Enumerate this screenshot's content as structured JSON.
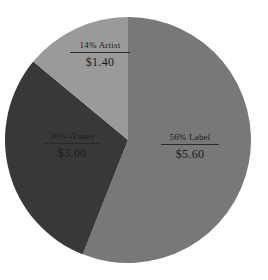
{
  "chart_data": {
    "type": "pie",
    "title": "",
    "subtitle": "",
    "xlabel": "",
    "ylabel": "",
    "legend": "none",
    "grid": false,
    "total_value": "$10.00",
    "start_angle_deg": 0,
    "direction": "clockwise",
    "categories": [
      "Label",
      "iTunes",
      "Artist"
    ],
    "values": [
      56,
      30,
      14
    ],
    "value_labels": [
      "$5.60",
      "$3.00",
      "$1.40"
    ],
    "percent_labels": [
      "56%",
      "30%",
      "14%"
    ],
    "colors": [
      "#787878",
      "#383838",
      "#9a9a9a"
    ],
    "slices": [
      {
        "name": "Label",
        "percent": 56,
        "percent_label": "56%",
        "heading": "56% Label",
        "amount": "$5.60",
        "color": "#787878",
        "start_deg": 0,
        "end_deg": 201.6
      },
      {
        "name": "iTunes",
        "percent": 30,
        "percent_label": "30%",
        "heading": "30% iTunes",
        "amount": "$3.00",
        "color": "#383838",
        "start_deg": 201.6,
        "end_deg": 309.6
      },
      {
        "name": "Artist",
        "percent": 14,
        "percent_label": "14%",
        "heading": "14% Artist",
        "amount": "$1.40",
        "color": "#9a9a9a",
        "start_deg": 309.6,
        "end_deg": 360
      }
    ]
  },
  "figure": {
    "background": "#ffffff",
    "text_color": "#1b1b1b",
    "center_x": 128,
    "center_y": 140,
    "radius": 123
  }
}
